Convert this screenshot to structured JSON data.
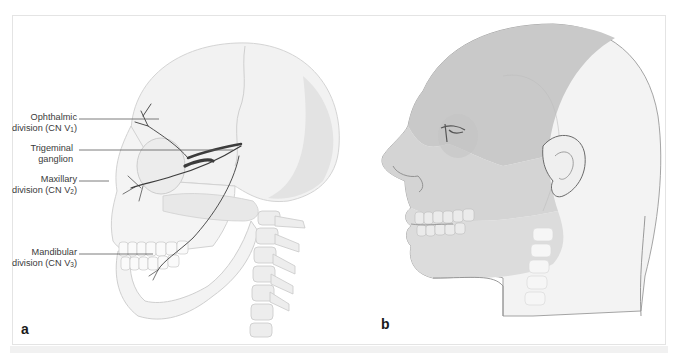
{
  "figure": {
    "panels": [
      {
        "id": "a",
        "letter": "a",
        "subject": "lateral view of skull with trigeminal nerve divisions",
        "labels": [
          {
            "line1": "Ophthalmic",
            "line2_prefix": "division (CN V",
            "subscript": "1",
            "line2_suffix": ")"
          },
          {
            "line1": "Trigeminal",
            "line2_prefix": "ganglion",
            "subscript": "",
            "line2_suffix": ""
          },
          {
            "line1": "Maxillary",
            "line2_prefix": "division (CN V",
            "subscript": "2",
            "line2_suffix": ")"
          },
          {
            "line1": "Mandibular",
            "line2_prefix": "division (CN V",
            "subscript": "3",
            "line2_suffix": ")"
          }
        ]
      },
      {
        "id": "b",
        "letter": "b",
        "subject": "lateral view of head showing sensory territories of trigeminal divisions"
      }
    ],
    "colors": {
      "frame_border": "#e4e4e4",
      "label_text": "#3a3a3a",
      "leader_line": "#5a5a5a",
      "nerve": "#3c3c3c",
      "skin_shade_dark": "#c9c9c9",
      "skin_shade_mid": "#d6d6d6",
      "skin_shade_light": "#e2e2e2",
      "unshaded_scalp": "#f3f3f3",
      "bone": "#eeeeee"
    }
  }
}
